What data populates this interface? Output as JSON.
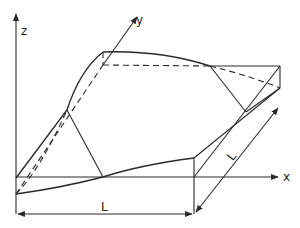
{
  "diagram": {
    "type": "3d-surface-sketch",
    "axes": {
      "x_label": "x",
      "y_label": "y",
      "z_label": "z"
    },
    "dimensions": {
      "length_x_label": "L",
      "length_y_label": "L"
    },
    "colors": {
      "line": "#2a2a2a",
      "background": "#ffffff"
    }
  }
}
